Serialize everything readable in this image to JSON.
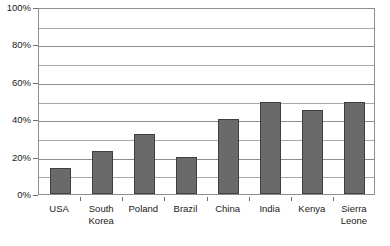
{
  "chart_data": {
    "type": "bar",
    "title": "",
    "subtitle": "",
    "xlabel": "",
    "ylabel": "",
    "categories": [
      "USA",
      "South\nKorea",
      "Poland",
      "Brazil",
      "China",
      "India",
      "Kenya",
      "Sierra\nLeone"
    ],
    "values": [
      14,
      23,
      32,
      20,
      40,
      49,
      45,
      49
    ],
    "ylim": [
      0,
      100
    ],
    "y_tick_labels": [
      "0%",
      "20%",
      "40%",
      "60%",
      "80%",
      "100%"
    ],
    "y_tick_values": [
      0,
      20,
      40,
      60,
      80,
      100
    ],
    "y_minor_gridline_values": [
      10,
      30,
      50,
      70,
      90
    ],
    "grid": true,
    "legend": false,
    "legend_position": "none",
    "bar_fill_color": "#6a6a6a",
    "bar_edge_color": "#3f3f3f",
    "grid_color": "#a8a8a8",
    "axis_color": "#8d8d8d",
    "text_color": "#1a1a1a",
    "background_color": "#ffffff"
  }
}
